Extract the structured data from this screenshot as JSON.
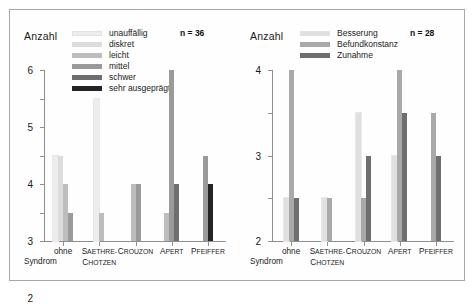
{
  "chart_data": [
    {
      "type": "bar",
      "panel": "left",
      "title": "",
      "ylabel": "Anzahl",
      "xlabel": "Syndrom",
      "ylim": [
        0,
        6
      ],
      "yticks": [
        0,
        1,
        2,
        3,
        4,
        5,
        6
      ],
      "grid": false,
      "legend_position": "top-center",
      "sample_size": "n = 36",
      "categories": [
        "ohne",
        "Saethre-Chotzen",
        "Crouzon",
        "Apert",
        "Pfeiffer"
      ],
      "category_labels": [
        {
          "line1": "ohne",
          "line2": ""
        },
        {
          "line1": "Saethre-",
          "line2": "Chotzen",
          "smallcaps": true
        },
        {
          "line1": "Crouzon",
          "line2": "",
          "smallcaps": true
        },
        {
          "line1": "Apert",
          "line2": "",
          "smallcaps": true
        },
        {
          "line1": "Pfeiffer",
          "line2": "",
          "smallcaps": true
        }
      ],
      "series": [
        {
          "name": "unauffällig",
          "color": "#ededed",
          "values": [
            3,
            5,
            0,
            0,
            0
          ]
        },
        {
          "name": "diskret",
          "color": "#dcdcdc",
          "values": [
            3,
            0,
            0,
            0,
            0
          ]
        },
        {
          "name": "leicht",
          "color": "#bdbdbd",
          "values": [
            2,
            1,
            2,
            1,
            0
          ]
        },
        {
          "name": "mittel",
          "color": "#9a9a9a",
          "values": [
            1,
            0,
            2,
            6,
            3
          ]
        },
        {
          "name": "schwer",
          "color": "#6e6e6e",
          "values": [
            0,
            0,
            0,
            2,
            0
          ]
        },
        {
          "name": "sehr ausgeprägt",
          "color": "#242424",
          "values": [
            0,
            0,
            0,
            0,
            2
          ]
        }
      ]
    },
    {
      "type": "bar",
      "panel": "right",
      "title": "",
      "ylabel": "Anzahl",
      "xlabel": "Syndrom",
      "ylim": [
        0,
        4
      ],
      "yticks": [
        0,
        1,
        2,
        3,
        4
      ],
      "grid": false,
      "legend_position": "top-center",
      "sample_size": "n = 28",
      "categories": [
        "ohne",
        "Saethre-Chotzen",
        "Crouzon",
        "Apert",
        "Pfeiffer"
      ],
      "category_labels": [
        {
          "line1": "ohne",
          "line2": ""
        },
        {
          "line1": "Saethre-",
          "line2": "Chotzen",
          "smallcaps": true
        },
        {
          "line1": "Crouzon",
          "line2": "",
          "smallcaps": true
        },
        {
          "line1": "Apert",
          "line2": "",
          "smallcaps": true
        },
        {
          "line1": "Pfeiffer",
          "line2": "",
          "smallcaps": true
        }
      ],
      "series": [
        {
          "name": "Besserung",
          "color": "#e0e0e0",
          "values": [
            1,
            1,
            3,
            2,
            0
          ]
        },
        {
          "name": "Befundkonstanz",
          "color": "#a9a9a9",
          "values": [
            4,
            1,
            1,
            4,
            3
          ]
        },
        {
          "name": "Zunahme",
          "color": "#6f6f6f",
          "values": [
            1,
            0,
            2,
            3,
            2
          ]
        }
      ]
    }
  ],
  "left": {
    "ylabel": "Anzahl",
    "n": "n = 36",
    "xword": "Syndrom",
    "legend": [
      {
        "label": "unauffällig",
        "color": "#ededed"
      },
      {
        "label": "diskret",
        "color": "#dcdcdc"
      },
      {
        "label": "leicht",
        "color": "#bdbdbd"
      },
      {
        "label": "mittel",
        "color": "#9a9a9a"
      },
      {
        "label": "schwer",
        "color": "#6e6e6e"
      },
      {
        "label": "sehr ausgeprägt",
        "color": "#242424"
      }
    ],
    "yticks": [
      "6",
      "5",
      "4",
      "3",
      "2",
      "1",
      "0"
    ],
    "xlabels": [
      {
        "l1": "ohne",
        "l2": ""
      },
      {
        "l1": "Saethre-",
        "l2": "Chotzen"
      },
      {
        "l1": "Crouzon",
        "l2": ""
      },
      {
        "l1": "Apert",
        "l2": ""
      },
      {
        "l1": "Pfeiffer",
        "l2": ""
      }
    ]
  },
  "right": {
    "ylabel": "Anzahl",
    "n": "n = 28",
    "xword": "Syndrom",
    "legend": [
      {
        "label": "Besserung",
        "color": "#e0e0e0"
      },
      {
        "label": "Befundkonstanz",
        "color": "#a9a9a9"
      },
      {
        "label": "Zunahme",
        "color": "#6f6f6f"
      }
    ],
    "yticks": [
      "4",
      "3",
      "2",
      "1",
      "0"
    ],
    "xlabels": [
      {
        "l1": "ohne",
        "l2": ""
      },
      {
        "l1": "Saethre-",
        "l2": "Chotzen"
      },
      {
        "l1": "Crouzon",
        "l2": ""
      },
      {
        "l1": "Apert",
        "l2": ""
      },
      {
        "l1": "Pfeiffer",
        "l2": ""
      }
    ]
  }
}
